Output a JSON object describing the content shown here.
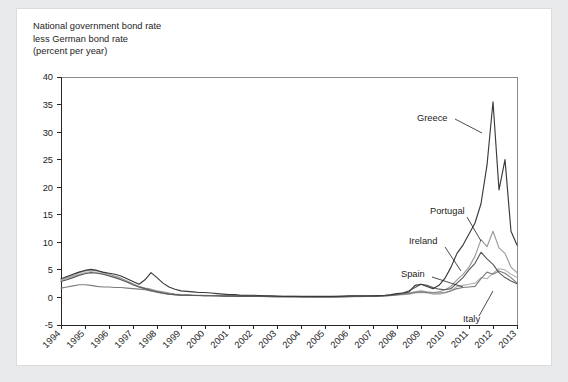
{
  "figure": {
    "title_lines": [
      "National government bond rate",
      "less German bond rate",
      "(percent per year)"
    ]
  },
  "chart_data": {
    "type": "line",
    "title": "National government bond rate less German bond rate (percent per year)",
    "xlabel": "",
    "ylabel": "percent per year",
    "ylim": [
      -5,
      40
    ],
    "yticks": [
      -5,
      0,
      5,
      10,
      15,
      20,
      25,
      30,
      35,
      40
    ],
    "xlim": [
      1994,
      2013
    ],
    "xticks": [
      1994,
      1995,
      1996,
      1997,
      1998,
      1999,
      2000,
      2001,
      2002,
      2003,
      2004,
      2005,
      2006,
      2007,
      2008,
      2009,
      2010,
      2011,
      2012,
      2013
    ],
    "xtick_labels": [
      "1994",
      "1995",
      "1996",
      "1997",
      "1998",
      "1999",
      "2000",
      "2001",
      "2002",
      "2003",
      "2004",
      "2005",
      "2006",
      "2007",
      "2008",
      "2009",
      "2010",
      "2011",
      "2012",
      "2013"
    ],
    "grid": false,
    "legend_position": "inline-annotations",
    "annotations": [
      {
        "text": "Greece",
        "series": "Greece"
      },
      {
        "text": "Portugal",
        "series": "Portugal"
      },
      {
        "text": "Ireland",
        "series": "Ireland"
      },
      {
        "text": "Spain",
        "series": "Spain"
      },
      {
        "text": "Italy",
        "series": "Italy"
      }
    ],
    "x": [
      1994.0,
      1994.25,
      1994.5,
      1994.75,
      1995.0,
      1995.25,
      1995.5,
      1995.75,
      1996.0,
      1996.25,
      1996.5,
      1996.75,
      1997.0,
      1997.25,
      1997.5,
      1997.75,
      1998.0,
      1998.25,
      1998.5,
      1998.75,
      1999.0,
      1999.25,
      1999.5,
      1999.75,
      2000.0,
      2000.25,
      2000.5,
      2000.75,
      2001.0,
      2001.25,
      2001.5,
      2001.75,
      2002.0,
      2002.25,
      2002.5,
      2002.75,
      2003.0,
      2003.25,
      2003.5,
      2003.75,
      2004.0,
      2004.25,
      2004.5,
      2004.75,
      2005.0,
      2005.25,
      2005.5,
      2005.75,
      2006.0,
      2006.25,
      2006.5,
      2006.75,
      2007.0,
      2007.25,
      2007.5,
      2007.75,
      2008.0,
      2008.25,
      2008.5,
      2008.75,
      2009.0,
      2009.25,
      2009.5,
      2009.75,
      2010.0,
      2010.25,
      2010.5,
      2010.75,
      2011.0,
      2011.25,
      2011.5,
      2011.75,
      2012.0,
      2012.25,
      2012.5,
      2012.75,
      2013.0
    ],
    "series": [
      {
        "name": "Greece",
        "color": "#3a3a3a",
        "values": [
          3.4,
          3.8,
          4.2,
          4.6,
          4.9,
          5.1,
          4.9,
          4.6,
          4.4,
          4.2,
          3.9,
          3.4,
          2.9,
          2.4,
          3.2,
          4.5,
          3.6,
          2.6,
          1.9,
          1.5,
          1.2,
          1.1,
          1.0,
          0.9,
          0.9,
          0.8,
          0.7,
          0.6,
          0.5,
          0.5,
          0.4,
          0.4,
          0.4,
          0.35,
          0.3,
          0.3,
          0.25,
          0.2,
          0.2,
          0.2,
          0.2,
          0.2,
          0.2,
          0.2,
          0.2,
          0.2,
          0.2,
          0.25,
          0.3,
          0.3,
          0.3,
          0.3,
          0.3,
          0.35,
          0.4,
          0.5,
          0.7,
          0.8,
          1.0,
          2.2,
          2.4,
          2.0,
          1.6,
          2.2,
          3.5,
          5.5,
          8.0,
          9.5,
          11.5,
          13.5,
          17.0,
          24.0,
          35.5,
          19.5,
          25.0,
          12.0,
          9.5
        ]
      },
      {
        "name": "Portugal",
        "color": "#9a9a9a",
        "values": [
          3.2,
          3.6,
          4.0,
          4.5,
          4.8,
          5.0,
          4.8,
          4.5,
          4.2,
          3.9,
          3.5,
          3.0,
          2.5,
          2.0,
          1.7,
          1.5,
          1.2,
          1.0,
          0.8,
          0.6,
          0.5,
          0.5,
          0.45,
          0.4,
          0.4,
          0.35,
          0.3,
          0.3,
          0.3,
          0.3,
          0.3,
          0.3,
          0.25,
          0.25,
          0.2,
          0.2,
          0.2,
          0.2,
          0.2,
          0.2,
          0.15,
          0.15,
          0.15,
          0.15,
          0.15,
          0.15,
          0.2,
          0.2,
          0.2,
          0.25,
          0.25,
          0.25,
          0.3,
          0.3,
          0.35,
          0.4,
          0.5,
          0.6,
          0.8,
          1.0,
          1.2,
          1.0,
          0.9,
          1.0,
          1.4,
          2.0,
          3.2,
          4.2,
          5.5,
          7.5,
          10.5,
          9.2,
          12.0,
          9.0,
          8.0,
          5.5,
          4.5
        ]
      },
      {
        "name": "Ireland",
        "color": "#5a5a5a",
        "values": [
          2.9,
          3.2,
          3.6,
          4.0,
          4.3,
          4.5,
          4.4,
          4.2,
          3.9,
          3.6,
          3.2,
          2.8,
          2.3,
          1.9,
          1.6,
          1.3,
          1.0,
          0.8,
          0.6,
          0.5,
          0.4,
          0.4,
          0.35,
          0.35,
          0.3,
          0.3,
          0.3,
          0.25,
          0.25,
          0.25,
          0.2,
          0.2,
          0.2,
          0.2,
          0.2,
          0.15,
          0.15,
          0.15,
          0.15,
          0.15,
          0.1,
          0.1,
          0.1,
          0.1,
          0.1,
          0.1,
          0.1,
          0.15,
          0.15,
          0.2,
          0.2,
          0.2,
          0.2,
          0.25,
          0.3,
          0.4,
          0.6,
          0.8,
          1.2,
          1.8,
          2.4,
          2.2,
          1.8,
          1.5,
          1.4,
          1.6,
          2.6,
          3.6,
          5.0,
          6.2,
          8.2,
          7.0,
          6.0,
          4.5,
          3.6,
          3.0,
          2.5
        ]
      },
      {
        "name": "Spain",
        "color": "#b4b4b4",
        "values": [
          3.0,
          3.4,
          3.8,
          4.2,
          4.5,
          4.7,
          4.5,
          4.3,
          4.0,
          3.7,
          3.3,
          2.8,
          2.3,
          1.9,
          1.5,
          1.2,
          0.9,
          0.7,
          0.6,
          0.5,
          0.4,
          0.4,
          0.35,
          0.3,
          0.3,
          0.3,
          0.25,
          0.25,
          0.25,
          0.2,
          0.2,
          0.2,
          0.2,
          0.2,
          0.15,
          0.15,
          0.15,
          0.15,
          0.1,
          0.1,
          0.1,
          0.1,
          0.1,
          0.1,
          0.1,
          0.1,
          0.1,
          0.1,
          0.15,
          0.15,
          0.15,
          0.2,
          0.2,
          0.2,
          0.25,
          0.3,
          0.4,
          0.5,
          0.6,
          0.8,
          0.9,
          0.8,
          0.6,
          0.6,
          0.8,
          1.2,
          2.0,
          2.2,
          2.4,
          2.6,
          3.6,
          3.4,
          4.4,
          5.2,
          5.0,
          4.2,
          3.6
        ]
      },
      {
        "name": "Italy",
        "color": "#7d7d7d",
        "values": [
          1.7,
          1.9,
          2.1,
          2.3,
          2.3,
          2.2,
          2.0,
          1.9,
          1.9,
          1.8,
          1.8,
          1.7,
          1.6,
          1.5,
          1.4,
          1.2,
          1.0,
          0.8,
          0.6,
          0.5,
          0.4,
          0.4,
          0.35,
          0.35,
          0.3,
          0.3,
          0.3,
          0.3,
          0.25,
          0.25,
          0.25,
          0.25,
          0.2,
          0.2,
          0.2,
          0.2,
          0.15,
          0.15,
          0.15,
          0.15,
          0.15,
          0.15,
          0.1,
          0.1,
          0.1,
          0.1,
          0.15,
          0.15,
          0.2,
          0.2,
          0.2,
          0.2,
          0.25,
          0.25,
          0.3,
          0.35,
          0.5,
          0.6,
          0.7,
          0.9,
          1.0,
          0.9,
          0.8,
          0.8,
          0.9,
          1.2,
          1.6,
          1.8,
          1.9,
          2.0,
          3.4,
          4.6,
          4.2,
          4.8,
          4.4,
          3.6,
          2.6
        ]
      }
    ]
  }
}
